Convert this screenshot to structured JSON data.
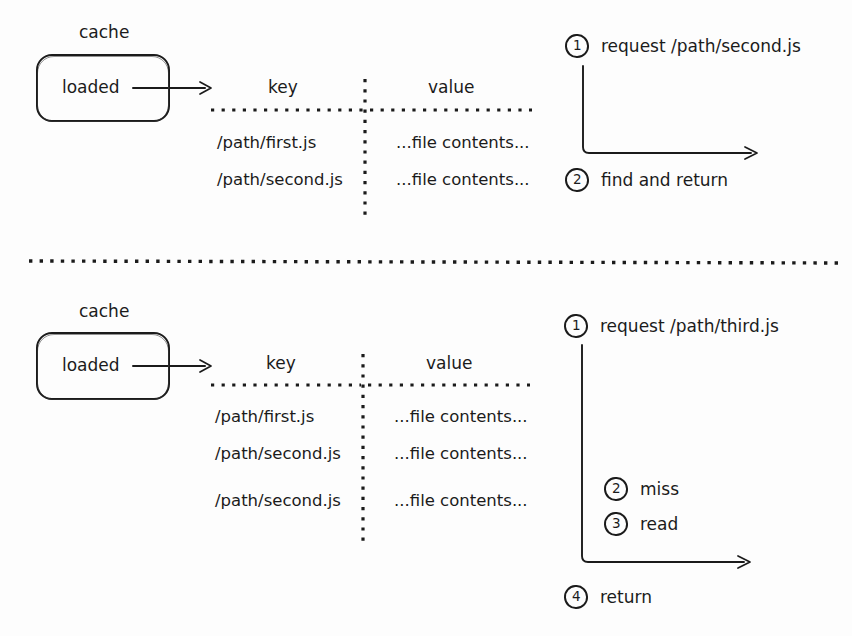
{
  "diagram": {
    "ink_color": "#1b1b1b",
    "background": "#fdfdfd"
  },
  "sections": [
    {
      "id": "hit",
      "cache_label": "cache",
      "box_label": "loaded",
      "table": {
        "headers": [
          "key",
          "value"
        ],
        "rows": [
          {
            "key": "/path/first.js",
            "value": "...file contents..."
          },
          {
            "key": "/path/second.js",
            "value": "...file contents..."
          }
        ]
      },
      "steps": [
        {
          "num": "1",
          "text": "request /path/second.js"
        },
        {
          "num": "2",
          "text": "find and return"
        }
      ]
    },
    {
      "id": "miss",
      "cache_label": "cache",
      "box_label": "loaded",
      "table": {
        "headers": [
          "key",
          "value"
        ],
        "rows": [
          {
            "key": "/path/first.js",
            "value": "...file contents..."
          },
          {
            "key": "/path/second.js",
            "value": "...file contents..."
          },
          {
            "key": "/path/second.js",
            "value": "...file contents..."
          }
        ]
      },
      "steps": [
        {
          "num": "1",
          "text": "request /path/third.js"
        },
        {
          "num": "2",
          "text": "miss"
        },
        {
          "num": "3",
          "text": "read"
        },
        {
          "num": "4",
          "text": "return"
        }
      ]
    }
  ]
}
